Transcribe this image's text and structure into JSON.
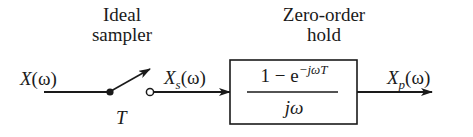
{
  "diagram": {
    "type": "block-diagram",
    "blocks": {
      "sampler": {
        "title_line1": "Ideal",
        "title_line2": "sampler",
        "period_label": "T"
      },
      "hold": {
        "title_line1": "Zero-order",
        "title_line2": "hold",
        "transfer_function": {
          "numerator_prefix": "1 − e",
          "numerator_exponent": "−jωT",
          "denominator": "jω"
        }
      }
    },
    "signals": {
      "input": {
        "name": "X",
        "sub": "",
        "arg": "(ω)"
      },
      "sampled": {
        "name": "X",
        "sub": "s",
        "arg": "(ω)"
      },
      "output": {
        "name": "X",
        "sub": "p",
        "arg": "(ω)"
      }
    },
    "colors": {
      "stroke": "#1a1a1a",
      "background": "#ffffff"
    }
  }
}
